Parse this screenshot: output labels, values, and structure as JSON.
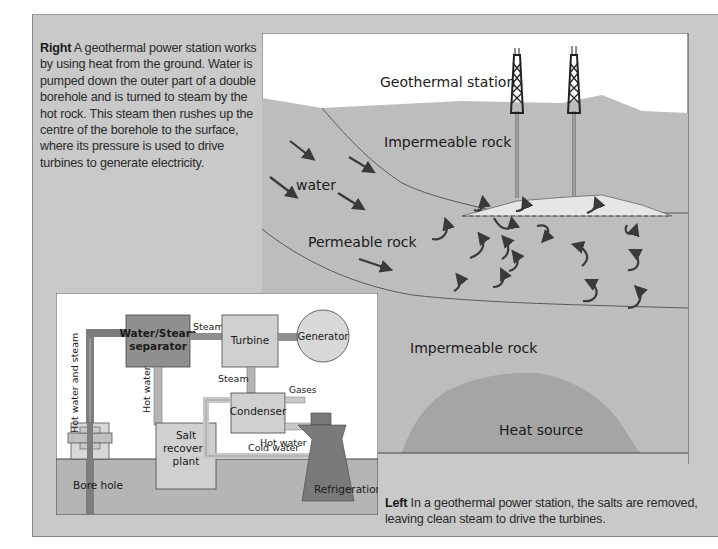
{
  "captions": {
    "right": {
      "lead": "Right",
      "text": " A geothermal power station works by using heat from the ground. Water is pumped down the outer part of a double borehole and is turned to steam by the hot rock. This steam then rushes up the centre of the borehole to the surface, where its pressure is used to drive turbines to generate electricity."
    },
    "left": {
      "lead": "Left",
      "text": " In a geothermal power station, the salts are removed, leaving clean steam to drive the turbines."
    }
  },
  "geothermal_diagram": {
    "labels": {
      "station": "Geothermal station",
      "impermeable_top": "Impermeable rock",
      "water": "water",
      "permeable": "Permeable rock",
      "impermeable_bottom": "Impermeable rock",
      "heat_source": "Heat source"
    },
    "colors": {
      "sky": "#ffffff",
      "rock": "#bdbdbd",
      "heat_source": "#a5a5a5",
      "steam_pocket": "#e6e6e6",
      "arrow": "#3a3a3a"
    }
  },
  "plant_diagram": {
    "labels": {
      "separator_line1": "Water/Steam",
      "separator_line2": "separator",
      "turbine": "Turbine",
      "generator": "Generator",
      "steam_top": "Steam",
      "steam_mid": "Steam",
      "gases": "Gases",
      "condenser": "Condenser",
      "hot_water_vertical": "Hot water",
      "hot_water_and_steam": "Hot water and steam",
      "salt_line1": "Salt",
      "salt_line2": "recovery",
      "salt_line3": "plant",
      "hot_water": "Hot water",
      "cold_water": "Cold water",
      "bore_hole": "Bore hole",
      "refrigeration": "Refrigeration"
    },
    "colors": {
      "separator": "#8f8f8f",
      "box": "#d0d0d0",
      "ground": "#b5b5b5",
      "pipe_dark": "#7d7d7d",
      "tower": "#7a7a7a"
    }
  }
}
